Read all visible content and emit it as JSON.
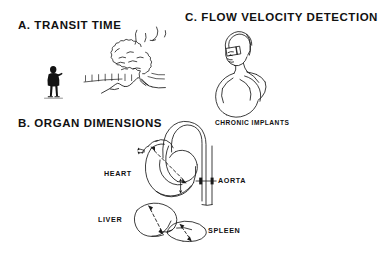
{
  "figure": {
    "type": "scientific-line-art-illustration",
    "background_color": "#ffffff",
    "ink_color": "#111111",
    "panels": [
      {
        "id": "a",
        "heading": "A. TRANSIT TIME",
        "illustration": "observer-watching-erupting-volcano",
        "elements": [
          "human-silhouette-observer",
          "volcano",
          "smoke-plume",
          "ash-fall-streaks"
        ]
      },
      {
        "id": "c",
        "heading": "C. FLOW VELOCITY DETECTION",
        "illustration": "seated-figure-bust-with-sensor",
        "elements": [
          "head-profile",
          "shoulder-arm-outline",
          "sensor-device"
        ]
      },
      {
        "id": "b",
        "heading": "B. ORGAN DIMENSIONS",
        "illustration": "anatomical-organ-outlines-with-dimension-arrows",
        "elements": [
          "heart-outline",
          "aortic-arch",
          "descending-aorta",
          "liver-outline",
          "spleen-outline",
          "dimension-arrows"
        ]
      }
    ]
  },
  "headings": {
    "panel_a": "A. TRANSIT TIME",
    "panel_b": "B. ORGAN DIMENSIONS",
    "panel_c": "C. FLOW VELOCITY DETECTION"
  },
  "labels": {
    "chronic_implants": "CHRONIC IMPLANTS",
    "heart": "HEART",
    "aorta": "AORTA",
    "liver": "LIVER",
    "spleen": "SPLEEN"
  },
  "colors": {
    "background": "#ffffff",
    "ink": "#111111",
    "line": "#1a1a1a"
  }
}
